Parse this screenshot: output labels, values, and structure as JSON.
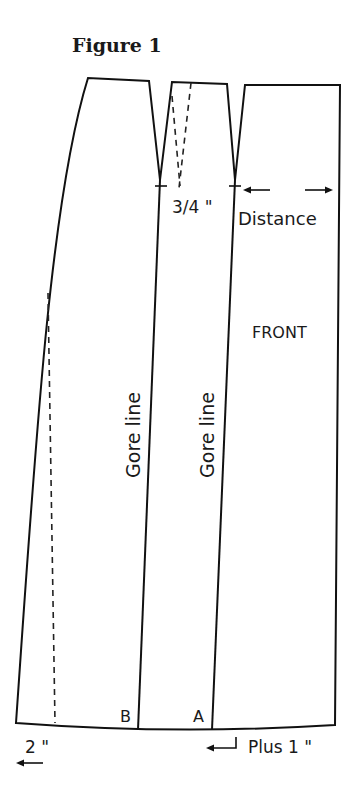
{
  "figure": {
    "title": "Figure 1",
    "labels": {
      "dart_width": "3/4 \"",
      "distance": "Distance",
      "front": "FRONT",
      "gore_line_left": "Gore line",
      "gore_line_middle": "Gore line",
      "point_b": "B",
      "point_a": "A",
      "left_extension": "2 \"",
      "right_extension": "Plus 1 \""
    },
    "icons": {
      "distance_left_arrow": "arrow-left",
      "distance_right_arrow": "arrow-right",
      "extension_left_arrow": "arrow-left",
      "return_arrow": "return-arrow-left"
    },
    "colors": {
      "line": "#111111",
      "background": "#ffffff"
    }
  }
}
